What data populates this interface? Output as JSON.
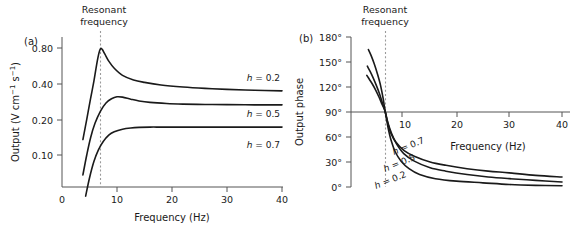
{
  "figure": {
    "panels": [
      {
        "letter": "(a)",
        "annotation": {
          "line1": "Resonant",
          "line2": "frequency",
          "at_hz": 7
        },
        "xlabel": "Frequency (Hz)",
        "ylabel": "Output (V cm⁻¹ s⁻¹)",
        "xticks": [
          "0",
          "10",
          "20",
          "30",
          "40"
        ],
        "yticks": [
          "0.80",
          "0.40",
          "0.20",
          "0.10"
        ],
        "series": [
          {
            "label_h": "h",
            "label_eq": " = 0.2"
          },
          {
            "label_h": "h",
            "label_eq": " = 0.5"
          },
          {
            "label_h": "h",
            "label_eq": " = 0.7"
          }
        ]
      },
      {
        "letter": "(b)",
        "annotation": {
          "line1": "Resonant",
          "line2": "frequency",
          "at_hz": 6.5
        },
        "xlabel": "Frequency (Hz)",
        "ylabel": "Output phase",
        "xticks": [
          "10",
          "20",
          "30",
          "40"
        ],
        "yticks": [
          "180°",
          "150°",
          "120°",
          "90°",
          "60°",
          "30°",
          "0°"
        ],
        "series": [
          {
            "label_h": "h",
            "label_eq": " = 0.7"
          },
          {
            "label_h": "h",
            "label_eq": " = 0.5"
          },
          {
            "label_h": "h",
            "label_eq": " = 0.2"
          }
        ]
      }
    ]
  },
  "chart_data": [
    {
      "type": "line",
      "panel": "a",
      "title": "",
      "xlabel": "Frequency (Hz)",
      "ylabel": "Output (V cm^-1 s^-1)",
      "xlim": [
        0,
        40
      ],
      "xticks": [
        0,
        10,
        20,
        30,
        40
      ],
      "yscale": "log",
      "ylim": [
        0.05,
        1.0
      ],
      "yticks": [
        0.1,
        0.2,
        0.4,
        0.8
      ],
      "ytick_labels": [
        "0.10",
        "0.20",
        "0.40",
        "0.80"
      ],
      "grid": false,
      "legend": "inline-right",
      "annotations": [
        {
          "text": "Resonant frequency",
          "x": 7,
          "style": "vertical-dashed-line"
        }
      ],
      "series": [
        {
          "name": "h = 0.2",
          "damping": 0.2,
          "x": [
            3.8,
            4.5,
            5.2,
            5.8,
            6.3,
            6.7,
            7.0,
            7.3,
            7.8,
            8.5,
            9.5,
            11,
            13,
            15,
            18,
            22,
            26,
            30,
            35,
            40
          ],
          "y": [
            0.135,
            0.2,
            0.3,
            0.42,
            0.58,
            0.72,
            0.79,
            0.78,
            0.71,
            0.62,
            0.54,
            0.47,
            0.43,
            0.41,
            0.39,
            0.375,
            0.365,
            0.358,
            0.352,
            0.348
          ],
          "peak": {
            "x": 7.1,
            "y": 0.79
          },
          "asymptote": 0.345
        },
        {
          "name": "h = 0.5",
          "damping": 0.5,
          "x": [
            3.8,
            4.5,
            5.2,
            6.0,
            7.0,
            8.0,
            9.0,
            10.0,
            11.0,
            12.5,
            14,
            16,
            19,
            22,
            26,
            30,
            35,
            40
          ],
          "y": [
            0.068,
            0.1,
            0.14,
            0.185,
            0.235,
            0.275,
            0.298,
            0.31,
            0.308,
            0.296,
            0.286,
            0.278,
            0.272,
            0.269,
            0.267,
            0.266,
            0.265,
            0.265
          ],
          "peak": {
            "x": 10.2,
            "y": 0.311
          },
          "asymptote": 0.265
        },
        {
          "name": "h = 0.7",
          "damping": 0.7,
          "x": [
            4.3,
            5.0,
            5.8,
            6.6,
            7.5,
            8.5,
            9.5,
            11,
            12.5,
            14,
            16,
            18,
            21,
            25,
            30,
            35,
            40
          ],
          "y": [
            0.045,
            0.064,
            0.088,
            0.11,
            0.13,
            0.147,
            0.157,
            0.165,
            0.169,
            0.171,
            0.172,
            0.172,
            0.172,
            0.172,
            0.172,
            0.172,
            0.172
          ],
          "peak": null,
          "asymptote": 0.172
        }
      ]
    },
    {
      "type": "line",
      "panel": "b",
      "title": "",
      "xlabel": "Frequency (Hz)",
      "ylabel": "Output phase",
      "xlim": [
        0,
        40
      ],
      "xticks": [
        10,
        20,
        30,
        40
      ],
      "ylim": [
        0,
        180
      ],
      "yticks": [
        0,
        30,
        60,
        90,
        120,
        150,
        180
      ],
      "ytick_labels": [
        "0°",
        "30°",
        "60°",
        "90°",
        "120°",
        "150°",
        "180°"
      ],
      "grid": false,
      "legend": "inline-along-curve",
      "annotations": [
        {
          "text": "Resonant frequency",
          "x": 6.5,
          "style": "vertical-dashed-line"
        },
        {
          "text": "90 degree crossing",
          "y": 90,
          "style": "horizontal-axis-line"
        }
      ],
      "series": [
        {
          "name": "h = 0.7",
          "damping": 0.7,
          "x": [
            3.3,
            3.8,
            4.4,
            5.0,
            5.6,
            6.1,
            6.5,
            7.0,
            7.6,
            8.5,
            10,
            12,
            15,
            18,
            22,
            26,
            30,
            35,
            40
          ],
          "y": [
            165,
            158,
            148,
            136,
            122,
            106,
            90,
            76,
            64,
            54,
            44,
            37,
            30,
            26,
            22,
            19,
            17,
            14,
            12
          ]
        },
        {
          "name": "h = 0.5",
          "damping": 0.5,
          "x": [
            3.1,
            3.6,
            4.2,
            4.8,
            5.4,
            6.0,
            6.5,
            7.0,
            7.7,
            8.6,
            10,
            12,
            15,
            18,
            22,
            26,
            30,
            35,
            40
          ],
          "y": [
            145,
            139,
            131,
            122,
            112,
            100,
            90,
            77,
            64,
            52,
            40,
            31,
            23,
            19,
            15,
            12,
            10,
            8,
            6
          ]
        },
        {
          "name": "h = 0.2",
          "damping": 0.2,
          "x": [
            3.0,
            3.5,
            4.1,
            4.7,
            5.3,
            5.9,
            6.5,
            7.0,
            7.6,
            8.4,
            9.5,
            11,
            13,
            16,
            20,
            25,
            30,
            35,
            40
          ],
          "y": [
            134,
            129,
            123,
            116,
            108,
            99,
            90,
            72,
            56,
            42,
            31,
            22,
            15,
            10,
            7,
            5,
            3,
            2,
            1.5
          ]
        }
      ]
    }
  ]
}
